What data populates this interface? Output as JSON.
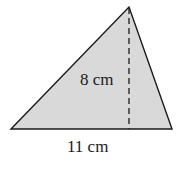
{
  "diagram": {
    "type": "triangle",
    "fill_color": "#d9d9d9",
    "stroke_color": "#1a1a1a",
    "height_label": "8 cm",
    "base_label": "11 cm"
  }
}
